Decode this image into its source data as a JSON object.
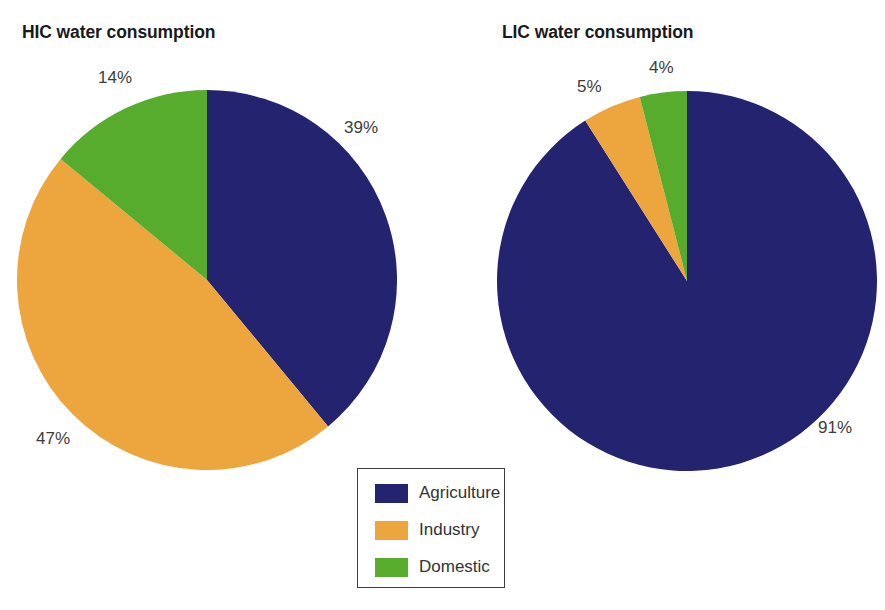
{
  "chart_data": [
    {
      "type": "pie",
      "title": "HIC water consumption",
      "categories": [
        "Agriculture",
        "Industry",
        "Domestic"
      ],
      "values": [
        39,
        47,
        14
      ],
      "labels": [
        "39%",
        "47%",
        "14%"
      ],
      "unit": "%",
      "colors": [
        "#232370",
        "#eda63e",
        "#57ac2d"
      ],
      "start_angle_deg": 0,
      "direction": "clockwise"
    },
    {
      "type": "pie",
      "title": "LIC water consumption",
      "categories": [
        "Agriculture",
        "Industry",
        "Domestic"
      ],
      "values": [
        91,
        5,
        4
      ],
      "labels": [
        "91%",
        "5%",
        "4%"
      ],
      "unit": "%",
      "colors": [
        "#232370",
        "#eda63e",
        "#57ac2d"
      ],
      "start_angle_deg": 0,
      "direction": "clockwise"
    }
  ],
  "charts": {
    "left": {
      "title": "HIC water consumption",
      "slices": {
        "agriculture": {
          "label": "39%",
          "value": 39
        },
        "industry": {
          "label": "47%",
          "value": 47
        },
        "domestic": {
          "label": "14%",
          "value": 14
        }
      }
    },
    "right": {
      "title": "LIC water consumption",
      "slices": {
        "agriculture": {
          "label": "91%",
          "value": 91
        },
        "industry": {
          "label": "5%",
          "value": 5
        },
        "domestic": {
          "label": "4%",
          "value": 4
        }
      }
    }
  },
  "legend": {
    "position": "bottom-center",
    "items": [
      {
        "label": "Agriculture",
        "color": "#232370"
      },
      {
        "label": "Industry",
        "color": "#eda63e"
      },
      {
        "label": "Domestic",
        "color": "#57ac2d"
      }
    ]
  },
  "colors": {
    "agriculture": "#232370",
    "industry": "#eda63e",
    "domestic": "#57ac2d",
    "background": "#ffffff",
    "text": "#1a1a1a",
    "legend_border": "#3f3f3f"
  }
}
